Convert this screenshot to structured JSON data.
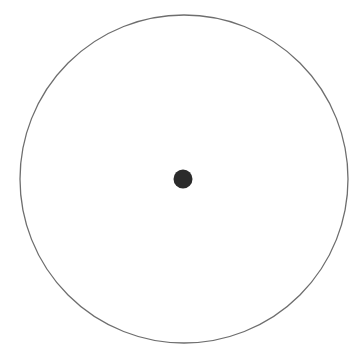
{
  "diagram": {
    "background": "#ffffff",
    "circle": {
      "cx": 184,
      "cy": 179,
      "r": 164,
      "stroke": "#6e6e6e",
      "stroke_width": 1.3
    },
    "center_dot": {
      "cx": 183,
      "cy": 179,
      "r": 9.5,
      "fill": "#2b2b2b"
    }
  }
}
